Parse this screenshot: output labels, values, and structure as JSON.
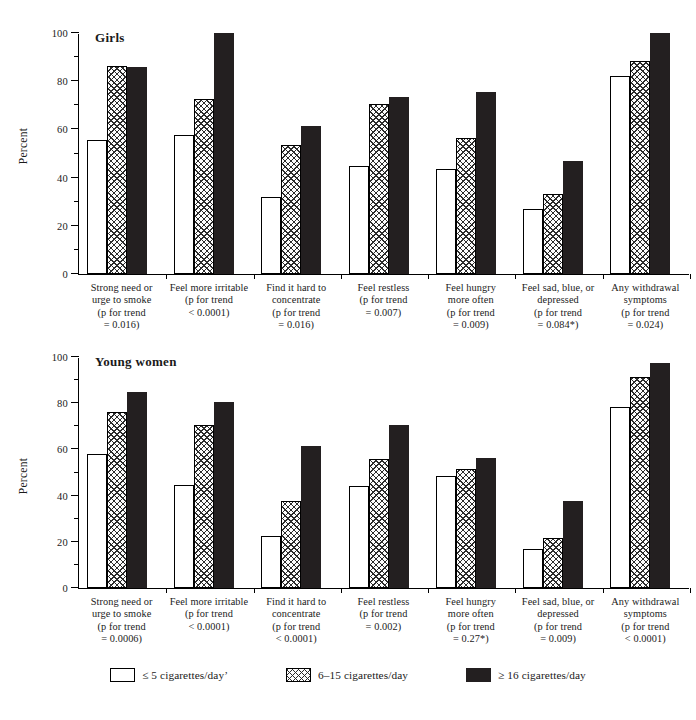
{
  "figure": {
    "panels": [
      {
        "id": "girls",
        "title": "Girls",
        "ylabel": "Percent"
      },
      {
        "id": "young-women",
        "title": "Young women",
        "ylabel": "Percent"
      }
    ]
  },
  "axis": {
    "ytick_labels": [
      "0",
      "20",
      "40",
      "60",
      "80",
      "100"
    ],
    "ylabel": "Percent"
  },
  "legend": {
    "items": [
      {
        "label": "≤ 5 cigarettes/day’",
        "style": "white",
        "color": "#ffffff"
      },
      {
        "label": "6–15 cigarettes/day",
        "style": "crosshatch",
        "color": "#fdfdfd"
      },
      {
        "label": "≥ 16 cigarettes/day",
        "style": "solid-black",
        "color": "#231f20"
      }
    ]
  },
  "chart_data": [
    {
      "type": "bar",
      "title": "Girls",
      "xlabel": "",
      "ylabel": "Percent",
      "ylim": [
        0,
        100
      ],
      "ytick_values": [
        0,
        20,
        40,
        60,
        80,
        100
      ],
      "grid": false,
      "legend_position": "bottom",
      "categories": [
        "Strong need or\nurge to smoke\n(p for trend\n= 0.016)",
        "Feel more irritable\n(p for trend\n< 0.0001)",
        "Find it hard to\nconcentrate\n(p for trend\n= 0.016)",
        "Feel restless\n(p for trend\n= 0.007)",
        "Feel hungry\nmore often\n(p for trend\n= 0.009)",
        "Feel sad, blue, or\ndepressed\n(p for trend\n= 0.084*)",
        "Any withdrawal\nsymptoms\n(p for trend\n= 0.024)"
      ],
      "category_names": [
        "Strong need or urge to smoke",
        "Feel more irritable",
        "Find it hard to concentrate",
        "Feel restless",
        "Feel hungry more often",
        "Feel sad, blue, or depressed",
        "Any withdrawal symptoms"
      ],
      "p_for_trend": [
        "= 0.016",
        "< 0.0001",
        "= 0.016",
        "= 0.007",
        "= 0.009",
        "= 0.084*",
        "= 0.024"
      ],
      "series": [
        {
          "name": "≤ 5 cigarettes/day’",
          "values": [
            55.5,
            57.5,
            32.0,
            45.0,
            43.5,
            27.0,
            82.0
          ]
        },
        {
          "name": "6–15 cigarettes/day",
          "values": [
            86.5,
            72.5,
            53.5,
            70.5,
            56.5,
            33.0,
            88.5
          ]
        },
        {
          "name": "≥ 16 cigarettes/day",
          "values": [
            86.0,
            100.0,
            61.5,
            73.5,
            75.5,
            47.0,
            100.0
          ]
        }
      ]
    },
    {
      "type": "bar",
      "title": "Young women",
      "xlabel": "",
      "ylabel": "Percent",
      "ylim": [
        0,
        100
      ],
      "ytick_values": [
        0,
        20,
        40,
        60,
        80,
        100
      ],
      "grid": false,
      "legend_position": "bottom",
      "categories": [
        "Strong need or\nurge to smoke\n(p for trend\n= 0.0006)",
        "Feel more irritable\n(p for trend\n< 0.0001)",
        "Find it hard to\nconcentrate\n(p for trend\n< 0.0001)",
        "Feel restless\n(p for trend\n= 0.002)",
        "Feel hungry\nmore often\n(p for trend\n= 0.27*)",
        "Feel sad, blue, or\ndepressed\n(p for trend\n= 0.009)",
        "Any withdrawal\nsymptoms\n(p for trend\n< 0.0001)"
      ],
      "category_names": [
        "Strong need or urge to smoke",
        "Feel more irritable",
        "Find it hard to concentrate",
        "Feel restless",
        "Feel hungry more often",
        "Feel sad, blue, or depressed",
        "Any withdrawal symptoms"
      ],
      "p_for_trend": [
        "= 0.0006",
        "< 0.0001",
        "< 0.0001",
        "= 0.002",
        "= 0.27*",
        "= 0.009",
        "< 0.0001"
      ],
      "series": [
        {
          "name": "≤ 5 cigarettes/day’",
          "values": [
            58.0,
            44.5,
            22.5,
            44.0,
            48.5,
            17.0,
            78.5
          ]
        },
        {
          "name": "6–15 cigarettes/day",
          "values": [
            76.0,
            70.5,
            37.5,
            56.0,
            51.5,
            21.5,
            91.5
          ]
        },
        {
          "name": "≥ 16 cigarettes/day",
          "values": [
            85.0,
            80.5,
            61.5,
            70.5,
            56.5,
            37.5,
            97.5
          ]
        }
      ]
    }
  ]
}
